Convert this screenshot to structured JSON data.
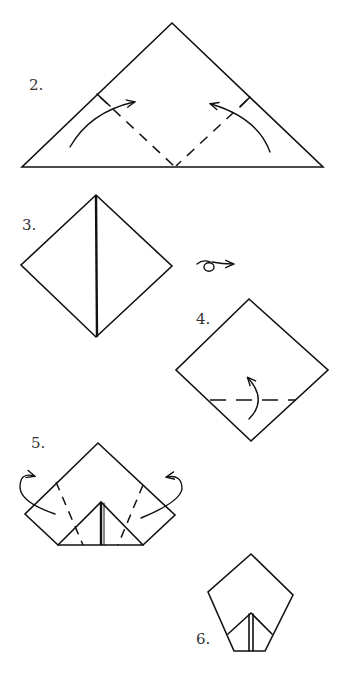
{
  "steps": [
    {
      "number": "2.",
      "description": "Triangle with two dashed valley folds meeting at bottom center; curved arrows fold the bottom corners up to the top"
    },
    {
      "number": "3.",
      "description": "Square diamond with a center vertical seam"
    },
    {
      "number": "4.",
      "description": "Diamond with a dashed horizontal fold near the bottom; curved arrow folds the bottom point up"
    },
    {
      "number": "5.",
      "description": "Pentagon-like shape with inner triangle; dashed folds on both sides and arrows folding the side flaps behind"
    },
    {
      "number": "6.",
      "description": "Finished pentagon shape with inner triangular pocket"
    }
  ],
  "symbols": {
    "flip_over": "turn-over-icon"
  },
  "colors": {
    "line": "#111111",
    "label": "#333333",
    "background": "#ffffff"
  }
}
